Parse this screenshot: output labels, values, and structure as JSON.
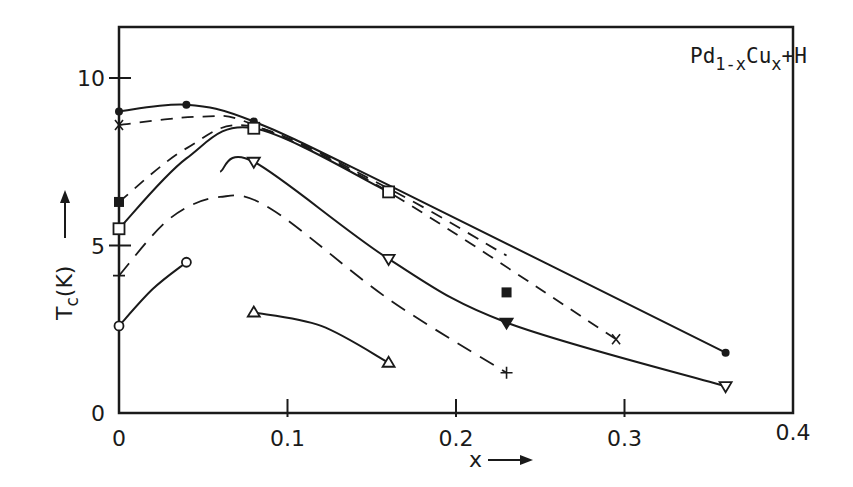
{
  "chart_data": {
    "type": "line",
    "title": "",
    "annotation": {
      "base": "Pd",
      "sub1": "1-x",
      "mid": "Cu",
      "sub2": "x",
      "tail": "+H"
    },
    "annotation_text": "Pd1-xCux+H",
    "xlabel": "x",
    "ylabel": "Tc(K)",
    "xlim": [
      0,
      0.4
    ],
    "ylim": [
      0,
      11.5
    ],
    "x_ticks": [
      {
        "value": 0,
        "label": "0"
      },
      {
        "value": 0.1,
        "label": "0.1"
      },
      {
        "value": 0.2,
        "label": "0.2"
      },
      {
        "value": 0.3,
        "label": "0.3"
      },
      {
        "value": 0.4,
        "label": "0.4"
      }
    ],
    "y_ticks": [
      {
        "value": 0,
        "label": "0"
      },
      {
        "value": 5,
        "label": "5"
      },
      {
        "value": 10,
        "label": "10"
      }
    ],
    "grid": false,
    "legend": "none",
    "series": [
      {
        "name": "filled-circle",
        "marker": "filled-circle",
        "line": "solid",
        "points": [
          [
            0,
            9.0
          ],
          [
            0.04,
            9.2
          ],
          [
            0.08,
            8.7
          ],
          [
            0.16,
            6.8
          ],
          [
            0.36,
            1.8
          ]
        ],
        "markers_at": [
          [
            0,
            9.0
          ],
          [
            0.04,
            9.2
          ],
          [
            0.08,
            8.7
          ],
          [
            0.36,
            1.8
          ]
        ]
      },
      {
        "name": "cross-x",
        "marker": "x",
        "line": "dashed",
        "points": [
          [
            0,
            8.6
          ],
          [
            0.05,
            8.85
          ],
          [
            0.08,
            8.6
          ],
          [
            0.16,
            6.6
          ],
          [
            0.295,
            2.2
          ]
        ],
        "markers_at": [
          [
            0,
            8.6
          ],
          [
            0.295,
            2.2
          ]
        ]
      },
      {
        "name": "filled-square",
        "marker": "filled-square",
        "line": "dashed",
        "points": [
          [
            0,
            6.3
          ],
          [
            0.04,
            7.9
          ],
          [
            0.08,
            8.55
          ],
          [
            0.16,
            6.7
          ],
          [
            0.23,
            4.7
          ]
        ],
        "markers_at": [
          [
            0,
            6.3
          ],
          [
            0.23,
            3.6
          ]
        ]
      },
      {
        "name": "open-square",
        "marker": "open-square",
        "line": "solid",
        "points": [
          [
            0,
            5.5
          ],
          [
            0.04,
            7.6
          ],
          [
            0.08,
            8.5
          ],
          [
            0.16,
            6.6
          ]
        ],
        "markers_at": [
          [
            0,
            5.5
          ],
          [
            0.08,
            8.5
          ],
          [
            0.16,
            6.6
          ]
        ]
      },
      {
        "name": "inverted-triangle",
        "marker": "open-inverted-triangle",
        "line": "solid",
        "points": [
          [
            0.06,
            7.2
          ],
          [
            0.08,
            7.5
          ],
          [
            0.16,
            4.6
          ],
          [
            0.23,
            2.7
          ],
          [
            0.36,
            0.8
          ]
        ],
        "markers_at": [
          [
            0.08,
            7.5
          ],
          [
            0.16,
            4.6
          ],
          [
            0.36,
            0.8
          ]
        ],
        "filled_markers_at": [
          [
            0.23,
            2.7
          ]
        ]
      },
      {
        "name": "plus",
        "marker": "plus",
        "line": "dashed",
        "points": [
          [
            0,
            4.1
          ],
          [
            0.03,
            5.8
          ],
          [
            0.06,
            6.45
          ],
          [
            0.09,
            6.1
          ],
          [
            0.16,
            3.4
          ],
          [
            0.23,
            1.2
          ]
        ],
        "markers_at": [
          [
            0,
            4.1
          ],
          [
            0.23,
            1.2
          ]
        ]
      },
      {
        "name": "open-circle",
        "marker": "open-circle",
        "line": "solid",
        "points": [
          [
            0,
            2.6
          ],
          [
            0.02,
            3.7
          ],
          [
            0.04,
            4.5
          ]
        ],
        "markers_at": [
          [
            0,
            2.6
          ],
          [
            0.04,
            4.5
          ]
        ]
      },
      {
        "name": "open-triangle",
        "marker": "open-triangle",
        "line": "solid",
        "points": [
          [
            0.08,
            3.0
          ],
          [
            0.12,
            2.6
          ],
          [
            0.16,
            1.5
          ]
        ],
        "markers_at": [
          [
            0.08,
            3.0
          ],
          [
            0.16,
            1.5
          ]
        ]
      }
    ]
  },
  "colors": {
    "ink": "#1a1a1a",
    "background": "#ffffff"
  }
}
